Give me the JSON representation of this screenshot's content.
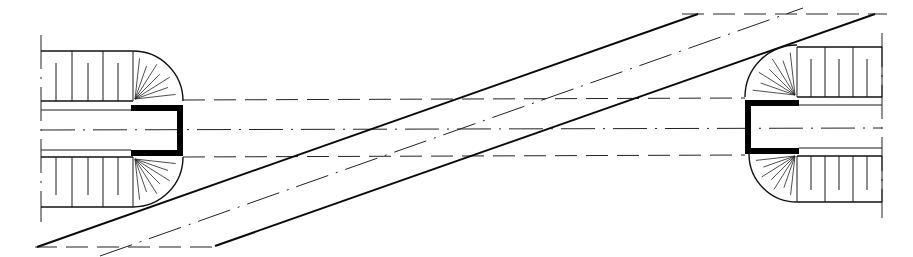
{
  "drawing": {
    "title": "Ramp with spiral stair landings - plan view",
    "colors": {
      "ink": "#111111",
      "background": "#ffffff",
      "wall_fill": "#000000"
    },
    "guides": {
      "top_dashed": {
        "x1": 682,
        "y1": 14,
        "x2": 887,
        "y2": 14
      },
      "bottom_dashed": {
        "x1": 35,
        "y1": 247,
        "x2": 217,
        "y2": 247
      },
      "horizontal_dashed_upper": {
        "x1": 183,
        "y1": 100,
        "x2": 745,
        "y2": 98
      },
      "horizontal_center_dashdot": {
        "x1": 41,
        "y1": 130,
        "x2": 882,
        "y2": 128
      },
      "horizontal_dashed_lower": {
        "x1": 183,
        "y1": 157,
        "x2": 745,
        "y2": 155
      }
    },
    "ramp": {
      "upper_edge": {
        "x1": 37,
        "y1": 247,
        "x2": 698,
        "y2": 14
      },
      "lower_edge": {
        "x1": 215,
        "y1": 246,
        "x2": 875,
        "y2": 14
      },
      "centerline": {
        "x1": 100,
        "y1": 256,
        "x2": 803,
        "y2": 8
      }
    },
    "left_landing": {
      "axis_x": 41,
      "axis_y1": 35,
      "axis_y2": 222,
      "top_stair": {
        "x1": 41,
        "x2": 133,
        "y_top": 51,
        "y_bot": 101,
        "dividers": [
          72,
          103,
          133
        ],
        "stubs": [
          56,
          88,
          118
        ]
      },
      "bottom_stair": {
        "x1": 41,
        "x2": 133,
        "y_top": 157,
        "y_bot": 207,
        "dividers": [
          72,
          103,
          133
        ],
        "stubs": [
          56,
          88,
          118
        ]
      },
      "inner_lines": [
        110,
        150
      ],
      "wall": {
        "x": 131,
        "x2": 183,
        "y_top": 105,
        "y_bot": 156,
        "t": 6
      },
      "arc_top": {
        "cx": 133,
        "cy": 101,
        "r": 50
      },
      "arc_bot": {
        "cx": 133,
        "cy": 157,
        "r": 50
      }
    },
    "right_landing": {
      "axis_x": 882,
      "axis_y1": 33,
      "axis_y2": 218,
      "top_stair": {
        "x1": 797,
        "x2": 882,
        "y_top": 47,
        "y_bot": 97,
        "dividers": [
          797,
          825,
          853,
          882
        ],
        "stubs": [
          811,
          839,
          867
        ]
      },
      "bottom_stair": {
        "x1": 797,
        "x2": 882,
        "y_top": 156,
        "y_bot": 202,
        "dividers": [
          797,
          825,
          853,
          882
        ],
        "stubs": [
          811,
          839,
          867
        ]
      },
      "inner_lines": [
        105,
        148
      ],
      "wall": {
        "x": 745,
        "x2": 799,
        "y_top": 100,
        "y_bot": 154,
        "t": 6
      },
      "arc_top": {
        "cx": 797,
        "cy": 97,
        "r": 52
      },
      "arc_bot": {
        "cx": 797,
        "cy": 154,
        "r": 48
      }
    }
  }
}
